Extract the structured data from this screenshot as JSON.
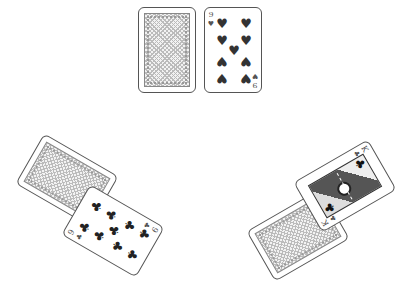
{
  "game": {
    "type": "card-table",
    "background_color": "#ffffff"
  },
  "cards": {
    "north_back": {
      "face": "down",
      "label": "card back"
    },
    "north_face": {
      "face": "up",
      "rank": "9",
      "suit": "hearts",
      "suit_symbol": "♥",
      "label": "9 of hearts"
    },
    "west_back": {
      "face": "down",
      "label": "card back"
    },
    "west_face": {
      "face": "up",
      "rank": "9",
      "suit": "clubs",
      "suit_symbol": "♣",
      "label": "9 of clubs"
    },
    "east_back": {
      "face": "down",
      "label": "card back"
    },
    "east_face": {
      "face": "up",
      "rank": "K",
      "suit": "clubs",
      "suit_symbol": "♣",
      "label": "King of clubs"
    }
  },
  "colors": {
    "card_border": "#555555",
    "suit_black": "#222222",
    "back_pattern": "#bbbbbb"
  }
}
